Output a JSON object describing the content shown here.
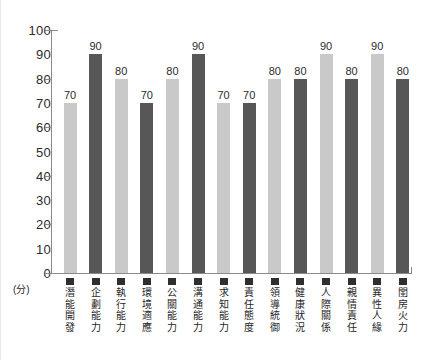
{
  "chart_data": {
    "type": "bar",
    "title": "",
    "subtitle": "",
    "xlabel": "",
    "ylabel": "",
    "unit_label": "(分)",
    "ylim": [
      0,
      100
    ],
    "ytick_step": 10,
    "grid": false,
    "legend": "none",
    "ytick_labels": [
      "100",
      "90",
      "80",
      "70",
      "60",
      "50",
      "40",
      "30",
      "20",
      "10",
      "0"
    ],
    "categories": [
      "潛能開發",
      "企劃能力",
      "執行能力",
      "環境適應",
      "公關能力",
      "溝通能力",
      "求知能力",
      "責任態度",
      "領導統御",
      "健康狀況",
      "人際關係",
      "親情責任",
      "異性人緣",
      "閨房火力"
    ],
    "values": [
      70,
      90,
      80,
      70,
      80,
      90,
      70,
      70,
      80,
      80,
      90,
      80,
      90,
      80
    ],
    "value_labels": [
      "70",
      "90",
      "80",
      "70",
      "80",
      "90",
      "70",
      "70",
      "80",
      "80",
      "90",
      "80",
      "90",
      "80"
    ],
    "bar_colors": [
      "#c9c9c9",
      "#575757",
      "#c9c9c9",
      "#575757",
      "#c9c9c9",
      "#575757",
      "#c9c9c9",
      "#575757",
      "#c9c9c9",
      "#575757",
      "#c9c9c9",
      "#575757",
      "#c9c9c9",
      "#575757"
    ],
    "marker_color": "#2f2f2f",
    "axis_color": "#8a8a8a",
    "text_color": "#2b2b2b"
  }
}
